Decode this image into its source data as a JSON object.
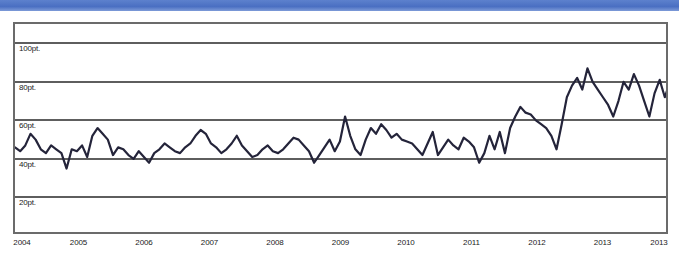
{
  "window": {
    "top_band_color": "#5077c6"
  },
  "chart_data": {
    "type": "line",
    "title": "",
    "subtitle": "",
    "xlabel": "",
    "ylabel": "",
    "unit": "pt.",
    "grid": true,
    "legend": null,
    "legend_position": "none",
    "line_color": "#24243a",
    "axis_color": "#5e5e5e",
    "ylim": [
      0,
      110
    ],
    "ytick_values": [
      100,
      80,
      60,
      40,
      20
    ],
    "ytick_labels": [
      "100pt.",
      "80pt.",
      "60pt.",
      "20pt.",
      "40pt."
    ],
    "yticks": [
      {
        "value": 100,
        "label": "100pt."
      },
      {
        "value": 80,
        "label": "80pt."
      },
      {
        "value": 60,
        "label": "60pt."
      },
      {
        "value": 40,
        "label": "40pt."
      },
      {
        "value": 20,
        "label": "20pt."
      }
    ],
    "xtick_labels": [
      "2004",
      "2005",
      "2006",
      "2007",
      "2008",
      "2009",
      "2010",
      "2011",
      "2012",
      "2013",
      "2013"
    ],
    "xticks": [
      {
        "label": "2004",
        "pos": 0
      },
      {
        "label": "2005",
        "pos": 1
      },
      {
        "label": "2006",
        "pos": 2
      },
      {
        "label": "2007",
        "pos": 3
      },
      {
        "label": "2008",
        "pos": 4
      },
      {
        "label": "2009",
        "pos": 5
      },
      {
        "label": "2010",
        "pos": 6
      },
      {
        "label": "2011",
        "pos": 7
      },
      {
        "label": "2012",
        "pos": 8
      },
      {
        "label": "2013",
        "pos": 9
      },
      {
        "label": "2013",
        "pos": 10
      }
    ],
    "xlim": [
      0,
      10
    ],
    "series": [
      {
        "name": "series-1",
        "color": "#24243a",
        "values": [
          46,
          44,
          47,
          53,
          50,
          45,
          43,
          47,
          45,
          43,
          35,
          45,
          44,
          47,
          41,
          52,
          56,
          53,
          50,
          42,
          46,
          45,
          42,
          40,
          44,
          41,
          38,
          43,
          45,
          48,
          46,
          44,
          43,
          46,
          48,
          52,
          55,
          53,
          48,
          46,
          43,
          45,
          48,
          52,
          47,
          44,
          41,
          42,
          45,
          47,
          44,
          43,
          45,
          48,
          51,
          50,
          47,
          44,
          38,
          42,
          46,
          50,
          44,
          49,
          62,
          52,
          45,
          42,
          50,
          56,
          53,
          58,
          55,
          51,
          53,
          50,
          49,
          48,
          45,
          42,
          48,
          54,
          42,
          46,
          50,
          47,
          45,
          51,
          49,
          46,
          38,
          43,
          52,
          45,
          54,
          43,
          56,
          62,
          67,
          64,
          63,
          60,
          58,
          56,
          52,
          45,
          58,
          72,
          78,
          82,
          76,
          87,
          80,
          76,
          72,
          68,
          62,
          70,
          80,
          76,
          84,
          78,
          70,
          62,
          74,
          81,
          72,
          80
        ]
      }
    ]
  }
}
